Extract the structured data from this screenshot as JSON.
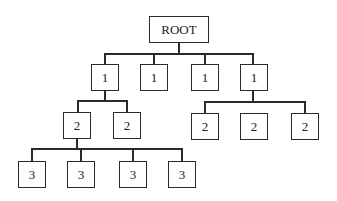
{
  "diagram": {
    "type": "tree",
    "root": {
      "label": "ROOT"
    },
    "level1": [
      {
        "label": "1"
      },
      {
        "label": "1"
      },
      {
        "label": "1"
      },
      {
        "label": "1"
      }
    ],
    "level2_left": [
      {
        "label": "2"
      },
      {
        "label": "2"
      }
    ],
    "level2_right": [
      {
        "label": "2"
      },
      {
        "label": "2"
      },
      {
        "label": "2"
      }
    ],
    "level3": [
      {
        "label": "3"
      },
      {
        "label": "3"
      },
      {
        "label": "3"
      },
      {
        "label": "3"
      }
    ],
    "colors": {
      "line": "#2a2a2a",
      "background": "#ffffff",
      "text": "#222222"
    }
  }
}
